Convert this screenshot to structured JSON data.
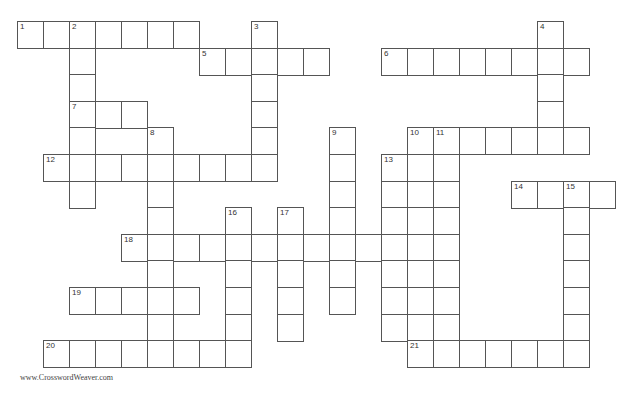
{
  "puzzle": {
    "origin_x": 17,
    "origin_y": 21,
    "cell_w": 26,
    "cell_h": 26.6,
    "border_color": "#555555",
    "entries": [
      {
        "number": 1,
        "direction": "across",
        "row": 0,
        "col": 0,
        "length": 7
      },
      {
        "number": 2,
        "direction": "down",
        "row": 0,
        "col": 2,
        "length": 7
      },
      {
        "number": 3,
        "direction": "down",
        "row": 0,
        "col": 9,
        "length": 6
      },
      {
        "number": 4,
        "direction": "down",
        "row": 0,
        "col": 20,
        "length": 5
      },
      {
        "number": 5,
        "direction": "across",
        "row": 1,
        "col": 7,
        "length": 5
      },
      {
        "number": 6,
        "direction": "across",
        "row": 1,
        "col": 14,
        "length": 8
      },
      {
        "number": 7,
        "direction": "across",
        "row": 3,
        "col": 2,
        "length": 3
      },
      {
        "number": 8,
        "direction": "down",
        "row": 4,
        "col": 5,
        "length": 9
      },
      {
        "number": 9,
        "direction": "down",
        "row": 4,
        "col": 12,
        "length": 7
      },
      {
        "number": 10,
        "direction": "across",
        "row": 4,
        "col": 15,
        "length": 7
      },
      {
        "number": 10,
        "direction": "down",
        "row": 4,
        "col": 15,
        "length": 9
      },
      {
        "number": 11,
        "direction": "down",
        "row": 4,
        "col": 16,
        "length": 9
      },
      {
        "number": 12,
        "direction": "across",
        "row": 5,
        "col": 1,
        "length": 9
      },
      {
        "number": 13,
        "direction": "down",
        "row": 5,
        "col": 14,
        "length": 7
      },
      {
        "number": 14,
        "direction": "across",
        "row": 6,
        "col": 19,
        "length": 4
      },
      {
        "number": 15,
        "direction": "down",
        "row": 6,
        "col": 21,
        "length": 7
      },
      {
        "number": 16,
        "direction": "down",
        "row": 7,
        "col": 8,
        "length": 5
      },
      {
        "number": 17,
        "direction": "down",
        "row": 7,
        "col": 10,
        "length": 5
      },
      {
        "number": 18,
        "direction": "across",
        "row": 8,
        "col": 4,
        "length": 13
      },
      {
        "number": 19,
        "direction": "across",
        "row": 10,
        "col": 2,
        "length": 5
      },
      {
        "number": 20,
        "direction": "across",
        "row": 12,
        "col": 1,
        "length": 8
      },
      {
        "number": 21,
        "direction": "across",
        "row": 12,
        "col": 15,
        "length": 7
      }
    ]
  },
  "footer": {
    "credit": "www.CrosswordWeaver.com"
  }
}
